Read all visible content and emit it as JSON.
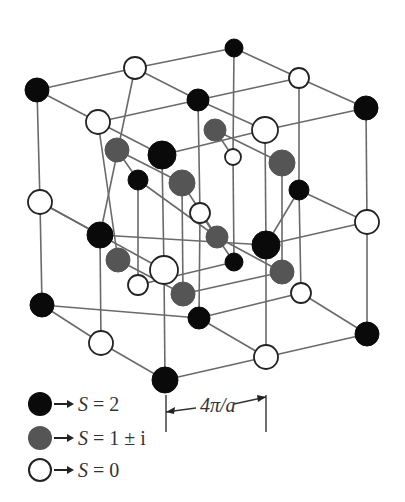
{
  "figure": {
    "title": "",
    "colors": {
      "black": "#0a0a0a",
      "gray": "#555555",
      "white": "#ffffff",
      "line": "#6a6a6a"
    }
  },
  "legend": {
    "items": [
      {
        "color_key": "black",
        "label_prefix": "S",
        "label_eq": " = ",
        "label_value": "2"
      },
      {
        "color_key": "gray",
        "label_prefix": "S",
        "label_eq": " = ",
        "label_value": "1 ± i"
      },
      {
        "color_key": "white",
        "label_prefix": "S",
        "label_eq": " = ",
        "label_value": "0"
      }
    ]
  },
  "dimension": {
    "label": "4π/a"
  },
  "nodes": [
    {
      "id": "n1",
      "x": 37,
      "y": 90,
      "r": 12,
      "type": "black"
    },
    {
      "id": "n2",
      "x": 135,
      "y": 68,
      "r": 11,
      "type": "white"
    },
    {
      "id": "n3",
      "x": 234,
      "y": 48,
      "r": 9,
      "type": "black"
    },
    {
      "id": "n4",
      "x": 98,
      "y": 122,
      "r": 12,
      "type": "white"
    },
    {
      "id": "n5",
      "x": 198,
      "y": 100,
      "r": 11,
      "type": "black"
    },
    {
      "id": "n6",
      "x": 299,
      "y": 78,
      "r": 10,
      "type": "white"
    },
    {
      "id": "n7",
      "x": 162,
      "y": 155,
      "r": 14,
      "type": "black"
    },
    {
      "id": "n8",
      "x": 265,
      "y": 130,
      "r": 13,
      "type": "white"
    },
    {
      "id": "n9",
      "x": 366,
      "y": 108,
      "r": 12,
      "type": "black"
    },
    {
      "id": "n10",
      "x": 117,
      "y": 150,
      "r": 12,
      "type": "gray"
    },
    {
      "id": "n11",
      "x": 215,
      "y": 130,
      "r": 11,
      "type": "gray"
    },
    {
      "id": "n12",
      "x": 233,
      "y": 157,
      "r": 8,
      "type": "white"
    },
    {
      "id": "n13",
      "x": 138,
      "y": 180,
      "r": 10,
      "type": "black"
    },
    {
      "id": "n14",
      "x": 182,
      "y": 183,
      "r": 13,
      "type": "gray"
    },
    {
      "id": "n15",
      "x": 282,
      "y": 163,
      "r": 13,
      "type": "gray"
    },
    {
      "id": "n16",
      "x": 299,
      "y": 190,
      "r": 10,
      "type": "black"
    },
    {
      "id": "n17",
      "x": 40,
      "y": 202,
      "r": 12,
      "type": "white"
    },
    {
      "id": "n18",
      "x": 200,
      "y": 213,
      "r": 10,
      "type": "white"
    },
    {
      "id": "n19",
      "x": 367,
      "y": 222,
      "r": 12,
      "type": "white"
    },
    {
      "id": "n20",
      "x": 100,
      "y": 235,
      "r": 13,
      "type": "black"
    },
    {
      "id": "n21",
      "x": 217,
      "y": 237,
      "r": 11,
      "type": "gray"
    },
    {
      "id": "n22",
      "x": 266,
      "y": 245,
      "r": 14,
      "type": "black"
    },
    {
      "id": "n23",
      "x": 118,
      "y": 260,
      "r": 12,
      "type": "gray"
    },
    {
      "id": "n24",
      "x": 234,
      "y": 262,
      "r": 9,
      "type": "black"
    },
    {
      "id": "n25",
      "x": 164,
      "y": 270,
      "r": 14,
      "type": "white"
    },
    {
      "id": "n26",
      "x": 282,
      "y": 272,
      "r": 12,
      "type": "gray"
    },
    {
      "id": "n27",
      "x": 138,
      "y": 285,
      "r": 10,
      "type": "white"
    },
    {
      "id": "n28",
      "x": 183,
      "y": 294,
      "r": 12,
      "type": "gray"
    },
    {
      "id": "n29",
      "x": 42,
      "y": 305,
      "r": 12,
      "type": "black"
    },
    {
      "id": "n30",
      "x": 199,
      "y": 318,
      "r": 11,
      "type": "black"
    },
    {
      "id": "n31",
      "x": 301,
      "y": 293,
      "r": 10,
      "type": "white"
    },
    {
      "id": "n32",
      "x": 367,
      "y": 334,
      "r": 12,
      "type": "black"
    },
    {
      "id": "n33",
      "x": 101,
      "y": 343,
      "r": 12,
      "type": "white"
    },
    {
      "id": "n34",
      "x": 266,
      "y": 357,
      "r": 12,
      "type": "white"
    },
    {
      "id": "n35",
      "x": 165,
      "y": 380,
      "r": 13,
      "type": "black"
    }
  ],
  "edges": [
    [
      "n1",
      "n2"
    ],
    [
      "n2",
      "n3"
    ],
    [
      "n1",
      "n4"
    ],
    [
      "n4",
      "n7"
    ],
    [
      "n2",
      "n5"
    ],
    [
      "n5",
      "n8"
    ],
    [
      "n3",
      "n6"
    ],
    [
      "n6",
      "n9"
    ],
    [
      "n4",
      "n5"
    ],
    [
      "n5",
      "n6"
    ],
    [
      "n7",
      "n8"
    ],
    [
      "n8",
      "n9"
    ],
    [
      "n1",
      "n17"
    ],
    [
      "n17",
      "n29"
    ],
    [
      "n2",
      "n20"
    ],
    [
      "n20",
      "n33"
    ],
    [
      "n3",
      "n12"
    ],
    [
      "n6",
      "n16"
    ],
    [
      "n16",
      "n31"
    ],
    [
      "n4",
      "n23"
    ],
    [
      "n7",
      "n25"
    ],
    [
      "n25",
      "n35"
    ],
    [
      "n8",
      "n22"
    ],
    [
      "n22",
      "n34"
    ],
    [
      "n9",
      "n19"
    ],
    [
      "n19",
      "n32"
    ],
    [
      "n5",
      "n18"
    ],
    [
      "n18",
      "n30"
    ],
    [
      "n17",
      "n20"
    ],
    [
      "n20",
      "n22"
    ],
    [
      "n17",
      "n25"
    ],
    [
      "n19",
      "n22"
    ],
    [
      "n19",
      "n16"
    ],
    [
      "n16",
      "n22"
    ],
    [
      "n29",
      "n33"
    ],
    [
      "n33",
      "n35"
    ],
    [
      "n29",
      "n30"
    ],
    [
      "n30",
      "n31"
    ],
    [
      "n31",
      "n32"
    ],
    [
      "n34",
      "n32"
    ],
    [
      "n35",
      "n34"
    ],
    [
      "n30",
      "n34"
    ],
    [
      "n10",
      "n14"
    ],
    [
      "n14",
      "n28"
    ],
    [
      "n11",
      "n15"
    ],
    [
      "n15",
      "n26"
    ],
    [
      "n13",
      "n21"
    ],
    [
      "n21",
      "n26"
    ],
    [
      "n13",
      "n27"
    ],
    [
      "n10",
      "n13"
    ],
    [
      "n12",
      "n24"
    ],
    [
      "n24",
      "n27"
    ],
    [
      "n18",
      "n24"
    ],
    [
      "n11",
      "n12"
    ],
    [
      "n23",
      "n28"
    ],
    [
      "n14",
      "n21"
    ],
    [
      "n28",
      "n26"
    ]
  ],
  "dimension_line": {
    "x1": 166,
    "x2": 266,
    "y": 412,
    "tick_top": 395,
    "tick_bottom": 432
  }
}
